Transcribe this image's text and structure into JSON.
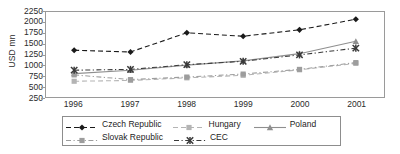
{
  "chart_data": {
    "type": "line",
    "title": "",
    "xlabel": "",
    "ylabel": "USD mn",
    "x": [
      1996,
      1997,
      1998,
      1999,
      2000,
      2001
    ],
    "categories": [
      "1996",
      "1997",
      "1998",
      "1999",
      "2000",
      "2001"
    ],
    "xtick_labels": [
      "1996",
      "1997",
      "1998",
      "1999",
      "2000",
      "2001"
    ],
    "ytick_labels": [
      "2250",
      "2000",
      "1750",
      "1500",
      "1250",
      "1000",
      "750",
      "500",
      "250"
    ],
    "ytick_values": [
      2250,
      2000,
      1750,
      1500,
      1250,
      1000,
      750,
      500,
      250
    ],
    "ylim": [
      250,
      2250
    ],
    "grid": false,
    "legend_position": "bottom",
    "series": [
      {
        "name": "Czech Republic",
        "values": [
          1350,
          1310,
          1760,
          1680,
          1830,
          2080
        ],
        "color": "#1a1a1a",
        "marker": "diamond",
        "dash": "dashed"
      },
      {
        "name": "Hungary",
        "values": [
          620,
          640,
          700,
          760,
          890,
          1040
        ],
        "color": "#b4b4b4",
        "marker": "square",
        "dash": "dashed"
      },
      {
        "name": "Poland",
        "values": [
          800,
          880,
          1000,
          1100,
          1270,
          1560
        ],
        "color": "#8f8f8f",
        "marker": "triangle",
        "dash": "solid"
      },
      {
        "name": "Slovak Republic",
        "values": [
          770,
          660,
          720,
          790,
          900,
          1060
        ],
        "color": "#9d9d9d",
        "marker": "square",
        "dash": "dashdot"
      },
      {
        "name": "CEC",
        "values": [
          880,
          900,
          1010,
          1090,
          1240,
          1400
        ],
        "color": "#3a3a3a",
        "marker": "x",
        "dash": "dashdot"
      }
    ]
  },
  "legend": {
    "rows": [
      [
        {
          "label": "Czech Republic"
        },
        {
          "label": "Hungary"
        },
        {
          "label": "Poland"
        }
      ],
      [
        {
          "label": "Slovak Republic"
        },
        {
          "label": "CEC"
        }
      ]
    ]
  }
}
